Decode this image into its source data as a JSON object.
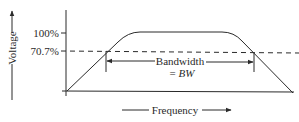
{
  "diagram": {
    "type": "frequency-response",
    "y_axis": {
      "label": "Voltage",
      "ticks": [
        {
          "label": "100%",
          "value": 1.0
        },
        {
          "label": "70.7%",
          "value": 0.707
        }
      ]
    },
    "x_axis": {
      "label": "Frequency"
    },
    "annotation": {
      "line1": "Bandwidth",
      "line2_prefix": "= ",
      "line2_var": "BW"
    },
    "colors": {
      "ink": "#2a2a2a",
      "background": "#ffffff"
    }
  }
}
